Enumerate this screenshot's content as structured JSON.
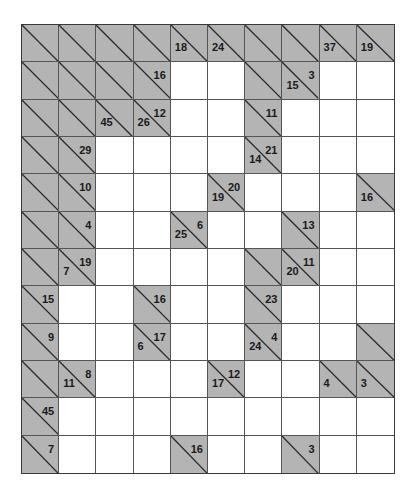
{
  "puzzle": {
    "type": "kakuro",
    "columns": 10,
    "rows_count": 12,
    "colors": {
      "clue_fill": "#b4b4b4",
      "white_fill": "#ffffff",
      "line": "#555555",
      "text": "#1a1a1a"
    },
    "rows": [
      [
        "B",
        "B",
        "B",
        "B",
        {
          "d": "18"
        },
        {
          "d": "24"
        },
        "B",
        "B",
        {
          "d": "37"
        },
        {
          "d": "19"
        }
      ],
      [
        "B",
        "B",
        "B",
        {
          "a": "16"
        },
        "W",
        "W",
        "B",
        {
          "d": "15",
          "a": "3"
        },
        "W",
        "W"
      ],
      [
        "B",
        "B",
        {
          "d": "45"
        },
        {
          "d": "26",
          "a": "12"
        },
        "W",
        "W",
        {
          "a": "11"
        },
        "W",
        "W",
        "W"
      ],
      [
        "B",
        {
          "a": "29"
        },
        "W",
        "W",
        "W",
        "W",
        {
          "d": "14",
          "a": "21"
        },
        "W",
        "W",
        "W"
      ],
      [
        "B",
        {
          "a": "10"
        },
        "W",
        "W",
        "W",
        {
          "d": "19",
          "a": "20"
        },
        "W",
        "W",
        "W",
        {
          "d": "16"
        }
      ],
      [
        "B",
        {
          "a": "4"
        },
        "W",
        "W",
        {
          "d": "25",
          "a": "6"
        },
        "W",
        "W",
        {
          "a": "13"
        },
        "W",
        "W"
      ],
      [
        "B",
        {
          "d": "7",
          "a": "19"
        },
        "W",
        "W",
        "W",
        "W",
        "B",
        {
          "d": "20",
          "a": "11"
        },
        "W",
        "W"
      ],
      [
        {
          "a": "15"
        },
        "W",
        "W",
        {
          "a": "16"
        },
        "W",
        "W",
        {
          "a": "23"
        },
        "W",
        "W",
        "W"
      ],
      [
        {
          "a": "9"
        },
        "W",
        "W",
        {
          "d": "6",
          "a": "17"
        },
        "W",
        "W",
        {
          "d": "24",
          "a": "4"
        },
        "W",
        "W",
        "B"
      ],
      [
        "B",
        {
          "d": "11",
          "a": "8"
        },
        "W",
        "W",
        "W",
        {
          "d": "17",
          "a": "12"
        },
        "W",
        "W",
        {
          "d": "4"
        },
        {
          "d": "3"
        }
      ],
      [
        {
          "a": "45"
        },
        "W",
        "W",
        "W",
        "W",
        "W",
        "W",
        "W",
        "W",
        "W"
      ],
      [
        {
          "a": "7"
        },
        "W",
        "W",
        "W",
        {
          "a": "16"
        },
        "W",
        "W",
        {
          "a": "3"
        },
        "W",
        "W"
      ]
    ]
  }
}
